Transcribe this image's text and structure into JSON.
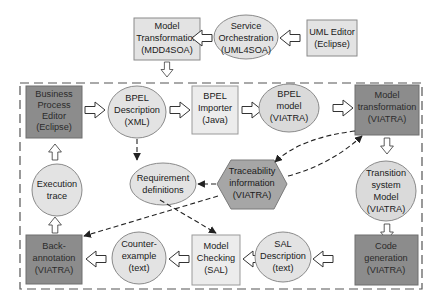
{
  "colors": {
    "light_fill": "#e6e6e6",
    "dark_fill": "#8c8c8c",
    "hex_fill": "#a6a6a6",
    "stroke": "#8a8a8a",
    "dashed_border": "#555555",
    "arrow": "#222222"
  },
  "external": {
    "model_transformation": {
      "lines": [
        "Model",
        "Transformation",
        "(MDD4SOA)"
      ],
      "shape": "box",
      "fill": "light"
    },
    "service_orchestration": {
      "lines": [
        "Service",
        "Orchestration",
        "(UML4SOA)"
      ],
      "shape": "ellipse",
      "fill": "light"
    },
    "uml_editor": {
      "lines": [
        "UML Editor",
        "(Eclipse)"
      ],
      "shape": "box",
      "fill": "light"
    }
  },
  "nodes": {
    "business_process_editor": {
      "lines": [
        "Business",
        "Process",
        "Editor",
        "(Eclipse)"
      ],
      "shape": "box",
      "fill": "dark"
    },
    "bpel_description": {
      "lines": [
        "BPEL",
        "Description",
        "(XML)"
      ],
      "shape": "ellipse",
      "fill": "light"
    },
    "bpel_importer": {
      "lines": [
        "BPEL",
        "Importer",
        "(Java)"
      ],
      "shape": "box",
      "fill": "light"
    },
    "bpel_model": {
      "lines": [
        "BPEL",
        "model",
        "(VIATRA)"
      ],
      "shape": "ellipse",
      "fill": "light"
    },
    "model_transformation_viatra": {
      "lines": [
        "Model",
        "transformation",
        "(VIATRA)"
      ],
      "shape": "box",
      "fill": "dark"
    },
    "execution_trace": {
      "lines": [
        "Execution",
        "trace"
      ],
      "shape": "ellipse",
      "fill": "light"
    },
    "requirement_definitions": {
      "lines": [
        "Requirement",
        "definitions"
      ],
      "shape": "ellipse",
      "fill": "light"
    },
    "traceability_information": {
      "lines": [
        "Traceability",
        "information",
        "(VIATRA)"
      ],
      "shape": "hexagon",
      "fill": "mid"
    },
    "transition_system_model": {
      "lines": [
        "Transition",
        "system",
        "Model",
        "(VIATRA)"
      ],
      "shape": "ellipse",
      "fill": "light"
    },
    "back_annotation": {
      "lines": [
        "Back-",
        "annotation",
        "(VIATRA)"
      ],
      "shape": "box",
      "fill": "dark"
    },
    "counter_example": {
      "lines": [
        "Counter-",
        "example",
        "(text)"
      ],
      "shape": "ellipse",
      "fill": "light"
    },
    "model_checking": {
      "lines": [
        "Model",
        "Checking",
        "(SAL)"
      ],
      "shape": "box",
      "fill": "light"
    },
    "sal_description": {
      "lines": [
        "SAL",
        "Description",
        "(text)"
      ],
      "shape": "ellipse",
      "fill": "light"
    },
    "code_generation": {
      "lines": [
        "Code",
        "generation",
        "(VIATRA)"
      ],
      "shape": "box",
      "fill": "dark"
    }
  },
  "edges": [
    {
      "from": "uml_editor",
      "to": "service_orchestration",
      "style": "block-arrow"
    },
    {
      "from": "service_orchestration",
      "to": "model_transformation",
      "style": "block-arrow"
    },
    {
      "from": "model_transformation",
      "to": "bpel_description",
      "style": "block-arrow"
    },
    {
      "from": "business_process_editor",
      "to": "bpel_description",
      "style": "block-arrow"
    },
    {
      "from": "bpel_description",
      "to": "bpel_importer",
      "style": "block-arrow"
    },
    {
      "from": "bpel_importer",
      "to": "bpel_model",
      "style": "block-arrow"
    },
    {
      "from": "bpel_model",
      "to": "model_transformation_viatra",
      "style": "block-arrow"
    },
    {
      "from": "model_transformation_viatra",
      "to": "transition_system_model",
      "style": "block-arrow"
    },
    {
      "from": "transition_system_model",
      "to": "code_generation",
      "style": "block-arrow"
    },
    {
      "from": "code_generation",
      "to": "sal_description",
      "style": "block-arrow"
    },
    {
      "from": "sal_description",
      "to": "model_checking",
      "style": "block-arrow"
    },
    {
      "from": "model_checking",
      "to": "counter_example",
      "style": "block-arrow"
    },
    {
      "from": "counter_example",
      "to": "back_annotation",
      "style": "block-arrow"
    },
    {
      "from": "back_annotation",
      "to": "execution_trace",
      "style": "block-arrow"
    },
    {
      "from": "execution_trace",
      "to": "business_process_editor",
      "style": "block-arrow"
    },
    {
      "from": "bpel_description",
      "to": "requirement_definitions",
      "style": "dashed"
    },
    {
      "from": "requirement_definitions",
      "to": "model_checking",
      "style": "dashed"
    },
    {
      "from": "traceability_information",
      "to": "requirement_definitions",
      "style": "dashed"
    },
    {
      "from": "model_transformation_viatra",
      "to": "traceability_information",
      "style": "dashed"
    },
    {
      "from": "traceability_information",
      "to": "model_transformation_viatra",
      "style": "dashed"
    },
    {
      "from": "traceability_information",
      "to": "back_annotation",
      "style": "dashed"
    }
  ]
}
